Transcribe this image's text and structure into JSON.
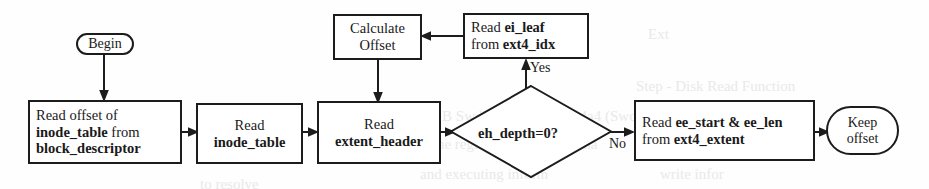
{
  "diagram": {
    "type": "flowchart",
    "stroke_color": "#1c1c1c",
    "background_color": "#fefefe"
  },
  "nodes": {
    "begin": {
      "label": "Begin",
      "shape": "terminator"
    },
    "read_offset": {
      "line1": "Read offset of",
      "line2_bold": "inode_table",
      "line2_rest": " from",
      "line3_bold": "block_descriptor",
      "shape": "process"
    },
    "read_inode_table": {
      "line1": "Read",
      "line2_bold": "inode_table",
      "shape": "process"
    },
    "read_extent_header": {
      "line1": "Read",
      "line2_bold": "extent_header",
      "shape": "process"
    },
    "calculate_offset": {
      "line1": "Calculate",
      "line2": "Offset",
      "shape": "process"
    },
    "read_ei_leaf": {
      "line1_pre": "Read ",
      "line1_bold": "ei_leaf",
      "line2_pre": "from ",
      "line2_bold": "ext4_idx",
      "shape": "process"
    },
    "decision": {
      "label": "eh_depth=0?",
      "shape": "decision"
    },
    "read_ee_start": {
      "line1_pre": "Read ",
      "line1_bold": "ee_start & ee_len",
      "line2_pre": "from ",
      "line2_bold": "ext4_extent",
      "shape": "process"
    },
    "keep_offset": {
      "line1": "Keep",
      "line2": "offset",
      "shape": "terminator"
    }
  },
  "edge_labels": {
    "yes": "Yes",
    "no": "No"
  },
  "bleed_through": {
    "t1": "Ext",
    "t2": "Step - Disk Read Function",
    "t3": "the B SwdBse4a4.SwdBse4a4 (SwdB)",
    "t4": "all the registers to the file. Tha",
    "t5": "and executing inform",
    "t6": "write infor",
    "t7": "to resolve"
  }
}
